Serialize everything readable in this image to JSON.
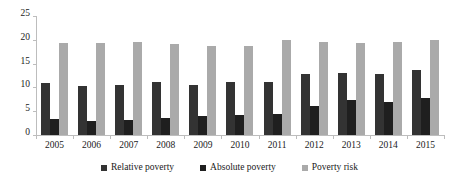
{
  "chart_data": {
    "type": "bar",
    "title": "",
    "subtitle": "",
    "xlabel": "",
    "ylabel": "",
    "ylim": [
      0,
      25
    ],
    "yticks": [
      0,
      5,
      10,
      15,
      20,
      25
    ],
    "grid": false,
    "legend_position": "bottom",
    "categories": [
      "2005",
      "2006",
      "2007",
      "2008",
      "2009",
      "2010",
      "2011",
      "2012",
      "2013",
      "2014",
      "2015"
    ],
    "series": [
      {
        "name": "Relative poverty",
        "color": "#333333",
        "values": [
          11.0,
          10.4,
          10.5,
          11.1,
          10.6,
          11.2,
          11.2,
          12.8,
          13.0,
          12.9,
          13.7
        ]
      },
      {
        "name": "Absolute poverty",
        "color": "#1f1f1f",
        "values": [
          3.3,
          2.9,
          3.1,
          3.6,
          3.9,
          4.2,
          4.4,
          6.0,
          7.4,
          6.9,
          7.7
        ]
      },
      {
        "name": "Poverty risk",
        "color": "#aaaaaa",
        "values": [
          19.3,
          19.4,
          19.6,
          19.1,
          18.6,
          18.8,
          19.9,
          19.6,
          19.4,
          19.6,
          20.0
        ]
      }
    ]
  },
  "axis": {
    "y_tick_labels": [
      "0",
      "5",
      "10",
      "15",
      "20",
      "25"
    ]
  },
  "legend": {
    "items": [
      {
        "label": "Relative poverty"
      },
      {
        "label": "Absolute poverty"
      },
      {
        "label": "Poverty risk"
      }
    ]
  }
}
